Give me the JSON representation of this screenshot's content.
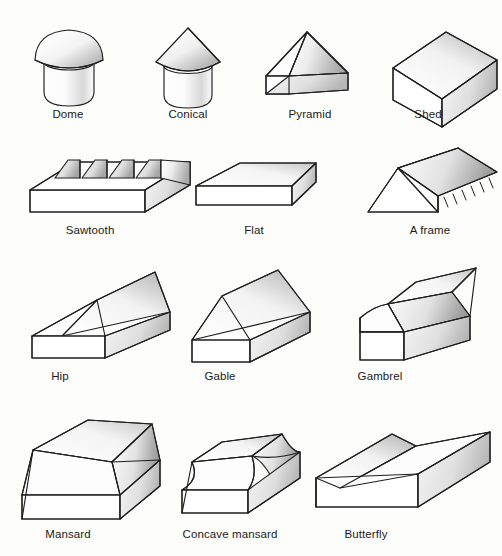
{
  "diagram": {
    "background_color": "#fdfdfc",
    "ink_color": "#1b1b1b",
    "style": "pencil line drawing with graphite shading, isometric 3D sketches"
  },
  "rows": [
    {
      "row_index": 1,
      "items": [
        {
          "label": "Dome",
          "icon": "dome-roof-icon",
          "label_x": 68,
          "label_y": 114
        },
        {
          "label": "Conical",
          "icon": "conical-roof-icon",
          "label_x": 188,
          "label_y": 114
        },
        {
          "label": "Pyramid",
          "icon": "pyramid-roof-icon",
          "label_x": 310,
          "label_y": 114
        },
        {
          "label": "Shed",
          "icon": "shed-roof-icon",
          "label_x": 428,
          "label_y": 114
        }
      ]
    },
    {
      "row_index": 2,
      "items": [
        {
          "label": "Sawtooth",
          "icon": "sawtooth-roof-icon",
          "label_x": 90,
          "label_y": 230
        },
        {
          "label": "Flat",
          "icon": "flat-roof-icon",
          "label_x": 254,
          "label_y": 230
        },
        {
          "label": "A frame",
          "icon": "a-frame-roof-icon",
          "label_x": 430,
          "label_y": 230
        }
      ]
    },
    {
      "row_index": 3,
      "items": [
        {
          "label": "Hip",
          "icon": "hip-roof-icon",
          "label_x": 60,
          "label_y": 374
        },
        {
          "label": "Gable",
          "icon": "gable-roof-icon",
          "label_x": 220,
          "label_y": 374
        },
        {
          "label": "Gambrel",
          "icon": "gambrel-roof-icon",
          "label_x": 380,
          "label_y": 374
        }
      ]
    },
    {
      "row_index": 4,
      "items": [
        {
          "label": "Mansard",
          "icon": "mansard-roof-icon",
          "label_x": 68,
          "label_y": 530
        },
        {
          "label": "Concave mansard",
          "icon": "concave-mansard-roof-icon",
          "label_x": 230,
          "label_y": 530
        },
        {
          "label": "Butterfly",
          "icon": "butterfly-roof-icon",
          "label_x": 366,
          "label_y": 530
        }
      ]
    }
  ]
}
